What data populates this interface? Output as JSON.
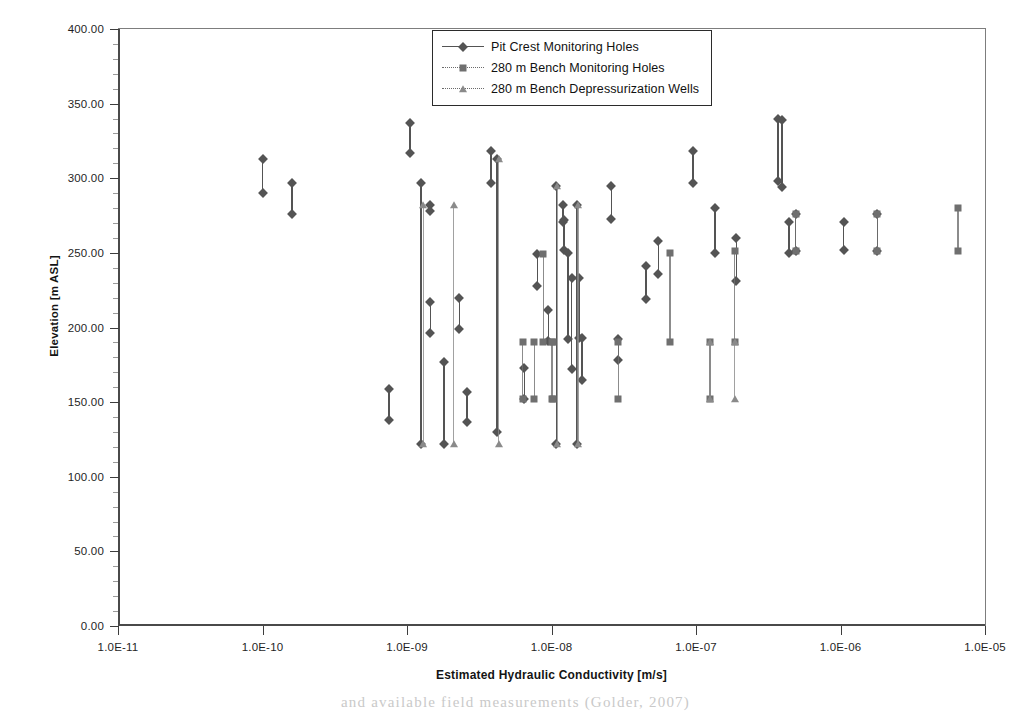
{
  "figure": {
    "caption_fragment": "and available field measurements (Golder, 2007)"
  },
  "chart_data": {
    "type": "scatter",
    "title": "",
    "xlabel": "Estimated Hydraulic Conductivity [m/s]",
    "ylabel": "Elevation [m ASL]",
    "xscale": "log",
    "xlim": [
      1e-11,
      1e-05
    ],
    "ylim": [
      0,
      400
    ],
    "grid": false,
    "legend_position": "top-center",
    "xtick_labels": [
      "1.0E-11",
      "1.0E-10",
      "1.0E-09",
      "1.0E-08",
      "1.0E-07",
      "1.0E-06",
      "1.0E-05"
    ],
    "xtick_values": [
      1e-11,
      1e-10,
      1e-09,
      1e-08,
      1e-07,
      1e-06,
      1e-05
    ],
    "ytick_labels": [
      "0.00",
      "50.00",
      "100.00",
      "150.00",
      "200.00",
      "250.00",
      "300.00",
      "350.00",
      "400.00"
    ],
    "ytick_values": [
      0,
      50,
      100,
      150,
      200,
      250,
      300,
      350,
      400
    ],
    "note": "Each datum is a vertical screen interval: a line from elevation y_bottom to y_top at a single estimated conductivity x, with a marker at each end.",
    "series": [
      {
        "name": "Pit Crest Monitoring Holes",
        "marker": "diamond",
        "line": "solid",
        "color": "#545454",
        "intervals": [
          {
            "x": 1e-10,
            "y_top": 313,
            "y_bottom": 290
          },
          {
            "x": 1.6e-10,
            "y_top": 297,
            "y_bottom": 276
          },
          {
            "x": 7.5e-10,
            "y_top": 159,
            "y_bottom": 138
          },
          {
            "x": 1.05e-09,
            "y_top": 337,
            "y_bottom": 317
          },
          {
            "x": 1.25e-09,
            "y_top": 297,
            "y_bottom": 122
          },
          {
            "x": 1.45e-09,
            "y_top": 282,
            "y_bottom": 278
          },
          {
            "x": 1.45e-09,
            "y_top": 217,
            "y_bottom": 196
          },
          {
            "x": 1.8e-09,
            "y_top": 177,
            "y_bottom": 122
          },
          {
            "x": 2.3e-09,
            "y_top": 220,
            "y_bottom": 199
          },
          {
            "x": 2.6e-09,
            "y_top": 157,
            "y_bottom": 137
          },
          {
            "x": 3.8e-09,
            "y_top": 318,
            "y_bottom": 297
          },
          {
            "x": 4.2e-09,
            "y_top": 313,
            "y_bottom": 130
          },
          {
            "x": 6.5e-09,
            "y_top": 173,
            "y_bottom": 152
          },
          {
            "x": 8e-09,
            "y_top": 249,
            "y_bottom": 228
          },
          {
            "x": 9.5e-09,
            "y_top": 212,
            "y_bottom": 191
          },
          {
            "x": 1.08e-08,
            "y_top": 295,
            "y_bottom": 122
          },
          {
            "x": 1.2e-08,
            "y_top": 282,
            "y_bottom": 271
          },
          {
            "x": 1.22e-08,
            "y_top": 272,
            "y_bottom": 252
          },
          {
            "x": 1.3e-08,
            "y_top": 250,
            "y_bottom": 192
          },
          {
            "x": 1.38e-08,
            "y_top": 233,
            "y_bottom": 172
          },
          {
            "x": 1.5e-08,
            "y_top": 282,
            "y_bottom": 122
          },
          {
            "x": 1.55e-08,
            "y_top": 233,
            "y_bottom": 193
          },
          {
            "x": 1.62e-08,
            "y_top": 193,
            "y_bottom": 165
          },
          {
            "x": 2.6e-08,
            "y_top": 295,
            "y_bottom": 273
          },
          {
            "x": 2.9e-08,
            "y_top": 192,
            "y_bottom": 178
          },
          {
            "x": 4.5e-08,
            "y_top": 241,
            "y_bottom": 219
          },
          {
            "x": 5.5e-08,
            "y_top": 258,
            "y_bottom": 236
          },
          {
            "x": 9.5e-08,
            "y_top": 318,
            "y_bottom": 297
          },
          {
            "x": 1.35e-07,
            "y_top": 280,
            "y_bottom": 250
          },
          {
            "x": 1.9e-07,
            "y_top": 260,
            "y_bottom": 231
          },
          {
            "x": 3.7e-07,
            "y_top": 340,
            "y_bottom": 298
          },
          {
            "x": 3.95e-07,
            "y_top": 339,
            "y_bottom": 294
          },
          {
            "x": 4.4e-07,
            "y_top": 271,
            "y_bottom": 250
          },
          {
            "x": 4.9e-07,
            "y_top": 276,
            "y_bottom": 251
          },
          {
            "x": 1.05e-06,
            "y_top": 271,
            "y_bottom": 252
          },
          {
            "x": 1.8e-06,
            "y_top": 276,
            "y_bottom": 251
          }
        ]
      },
      {
        "name": "280 m Bench Monitoring Holes",
        "marker": "square",
        "line": "dotted",
        "color": "#6f6f6f",
        "intervals": [
          {
            "x": 6.3e-09,
            "y_top": 190,
            "y_bottom": 152
          },
          {
            "x": 7.6e-09,
            "y_top": 190,
            "y_bottom": 152
          },
          {
            "x": 8.8e-09,
            "y_top": 249,
            "y_bottom": 190
          },
          {
            "x": 1e-08,
            "y_top": 190,
            "y_bottom": 152
          },
          {
            "x": 1.02e-08,
            "y_top": 190,
            "y_bottom": 152
          },
          {
            "x": 2.9e-08,
            "y_top": 190,
            "y_bottom": 152
          },
          {
            "x": 6.6e-08,
            "y_top": 250,
            "y_bottom": 190
          },
          {
            "x": 1.25e-07,
            "y_top": 190,
            "y_bottom": 152
          },
          {
            "x": 1.85e-07,
            "y_top": 251,
            "y_bottom": 190
          },
          {
            "x": 4.9e-07,
            "y_top": 276,
            "y_bottom": 251
          },
          {
            "x": 1.8e-06,
            "y_top": 276,
            "y_bottom": 251
          },
          {
            "x": 6.5e-06,
            "y_top": 280,
            "y_bottom": 251
          }
        ]
      },
      {
        "name": "280 m Bench Depressurization Wells",
        "marker": "triangle",
        "line": "dotted",
        "color": "#8a8a8a",
        "intervals": [
          {
            "x": 1.3e-09,
            "y_top": 282,
            "y_bottom": 122
          },
          {
            "x": 2.1e-09,
            "y_top": 282,
            "y_bottom": 122
          },
          {
            "x": 4.3e-09,
            "y_top": 313,
            "y_bottom": 122
          },
          {
            "x": 1.1e-08,
            "y_top": 295,
            "y_bottom": 122
          },
          {
            "x": 1.52e-08,
            "y_top": 282,
            "y_bottom": 122
          },
          {
            "x": 1.25e-07,
            "y_top": 190,
            "y_bottom": 152
          },
          {
            "x": 1.85e-07,
            "y_top": 190,
            "y_bottom": 152
          }
        ]
      }
    ]
  }
}
